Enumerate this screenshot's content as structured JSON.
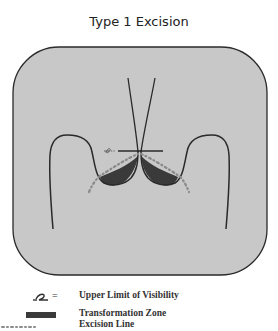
{
  "title": "Type 1 Excision",
  "colors": {
    "background": "#ffffff",
    "cervix_fill": "#c8c8c8",
    "outline": "#2a2a2a",
    "transformation_zone": "#3a3a3a",
    "excision_line": "#8a8a8a"
  },
  "diagram": {
    "elements": [
      {
        "name": "cervix-outline",
        "type": "rounded-rectangle"
      },
      {
        "name": "endocervical-canal",
        "type": "converging-lines"
      },
      {
        "name": "upper-limit-of-visibility-marker",
        "type": "crossbar"
      },
      {
        "name": "transformation-zone-left",
        "type": "filled-crescent"
      },
      {
        "name": "transformation-zone-right",
        "type": "filled-crescent"
      },
      {
        "name": "excision-line",
        "type": "dash-dot-line"
      }
    ]
  },
  "legend": {
    "items": [
      {
        "symbol": "upper-limit-glyph",
        "equals": "=",
        "label": "Upper Limit of Visibility"
      },
      {
        "symbol": "filled-bar",
        "label": "Transformation Zone"
      },
      {
        "symbol": "dash-dot",
        "label": "Excision Line"
      }
    ]
  }
}
